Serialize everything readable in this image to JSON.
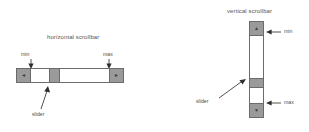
{
  "figures": {
    "horizontal": {
      "caption": "horizontal scrollbar",
      "labels": {
        "min": "min",
        "max": "max",
        "slider": "slider"
      },
      "left_arrow_glyph": "◄",
      "right_arrow_glyph": "►"
    },
    "vertical": {
      "caption": "vertical scrollbar",
      "labels": {
        "min": "min",
        "max": "max",
        "slider": "slider"
      },
      "up_arrow_glyph": "▲",
      "down_arrow_glyph": "▼"
    }
  },
  "colors": {
    "button_fill": "#9a9a9a",
    "thumb_fill": "#9a9a9a",
    "track_fill": "#ffffff",
    "outline": "#6b6b6b",
    "text": "#4d4d4d",
    "background": "#ffffff"
  }
}
